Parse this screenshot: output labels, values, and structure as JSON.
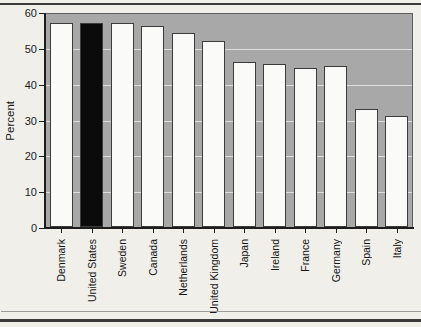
{
  "chart_data": {
    "type": "bar",
    "categories": [
      "Denmark",
      "United States",
      "Sweden",
      "Canada",
      "Netherlands",
      "United Kingdom",
      "Japan",
      "Ireland",
      "France",
      "Germany",
      "Spain",
      "Italy"
    ],
    "values": [
      57,
      57,
      57,
      56,
      54,
      52,
      46,
      45.5,
      44.5,
      45,
      33,
      31
    ],
    "ylabel": "Percent",
    "ylim": [
      0,
      60
    ],
    "yticks": [
      0,
      10,
      20,
      30,
      40,
      50,
      60
    ],
    "gridlines": [
      10,
      20,
      30,
      40,
      50
    ],
    "grid_on": true,
    "legend": "none",
    "highlight": {
      "category": "United States",
      "index": 1,
      "color": "#0b0b0b"
    },
    "colors": {
      "plot_background": "#a8a8a8",
      "bar_fill": "#fafaf8",
      "bar_border": "#3c3c3c",
      "gridline": "#dedede",
      "axis": "#1d1d1d",
      "text": "#1a1a1a"
    }
  }
}
